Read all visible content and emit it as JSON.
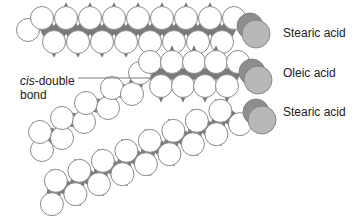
{
  "figure": {
    "molecules": [
      {
        "id": "stearic-1",
        "label": "Stearic acid",
        "type": "saturated"
      },
      {
        "id": "oleic",
        "label": "Oleic acid",
        "type": "unsaturated"
      },
      {
        "id": "stearic-2",
        "label": "Stearic acid",
        "type": "saturated"
      }
    ],
    "annotation": {
      "italic_part": "cis",
      "rest_line1": "-double",
      "line2": "bond"
    },
    "colors": {
      "atom_fill": "#ffffff",
      "atom_stroke": "#8a8a8a",
      "bond_fill": "#7a7a7a",
      "head_fill": "#b8b8b8",
      "head_shadow": "#8e8e8e",
      "text": "#222222"
    }
  }
}
